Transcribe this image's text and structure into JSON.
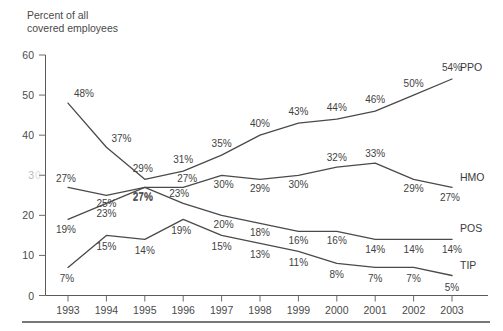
{
  "chart_data": {
    "type": "line",
    "title": "",
    "ylabel": "Percent of all covered employees",
    "xlabel": "",
    "categories": [
      "1993",
      "1994",
      "1995",
      "1996",
      "1997",
      "1998",
      "1999",
      "2000",
      "2001",
      "2002",
      "2003"
    ],
    "ylim": [
      0,
      60
    ],
    "yticks": [
      0,
      10,
      20,
      30,
      40,
      50,
      60
    ],
    "ytick_labels": [
      "0",
      "10",
      "20",
      "3",
      "40",
      "50",
      "60"
    ],
    "grid": false,
    "legend_position": "right-inline-series-labels",
    "series": [
      {
        "name": "PPO",
        "values": [
          48,
          37,
          29,
          31,
          35,
          40,
          43,
          44,
          46,
          50,
          54
        ],
        "labels": [
          "48%",
          "37%",
          "29%",
          "31%",
          "35%",
          "40%",
          "43%",
          "44%",
          "46%",
          "50%",
          "54%"
        ]
      },
      {
        "name": "HMO",
        "values": [
          27,
          25,
          27,
          27,
          30,
          29,
          30,
          32,
          33,
          29,
          27
        ],
        "labels": [
          "27%",
          "25%",
          "27%",
          "27%",
          "30%",
          "29%",
          "30%",
          "32%",
          "33%",
          "29%",
          "27%"
        ]
      },
      {
        "name": "POS",
        "values": [
          19,
          23,
          27,
          23,
          20,
          18,
          16,
          16,
          14,
          14,
          14
        ],
        "labels": [
          "19%",
          "23%",
          "27%",
          "23%",
          "20%",
          "18%",
          "16%",
          "16%",
          "14%",
          "14%",
          "14%"
        ]
      },
      {
        "name": "TIP",
        "values": [
          7,
          15,
          14,
          19,
          15,
          13,
          11,
          8,
          7,
          7,
          5
        ],
        "labels": [
          "7%",
          "15%",
          "14%",
          "19%",
          "15%",
          "13%",
          "11%",
          "8%",
          "7%",
          "7%",
          "5%"
        ]
      }
    ]
  },
  "axis": {
    "y_title_line1": "Percent of all",
    "y_title_line2": "covered employees"
  },
  "colors": {
    "line": "#4a4a4a",
    "text": "#3f3f3f",
    "axis": "#5a5a5a",
    "background": "#ffffff"
  }
}
